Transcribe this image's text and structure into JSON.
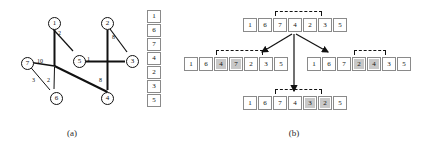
{
  "figure": {
    "panels": [
      {
        "id": "a",
        "caption": "(a)"
      },
      {
        "id": "b",
        "caption": "(b)"
      }
    ]
  },
  "panel_a": {
    "caption": "(a)",
    "graph": {
      "nodes": [
        {
          "id": "1",
          "label": "1",
          "x": 48,
          "y": 17
        },
        {
          "id": "2",
          "label": "2",
          "x": 101,
          "y": 17
        },
        {
          "id": "3",
          "label": "3",
          "x": 126,
          "y": 55
        },
        {
          "id": "4",
          "label": "4",
          "x": 101,
          "y": 92
        },
        {
          "id": "5",
          "label": "5",
          "x": 73,
          "y": 55
        },
        {
          "id": "6",
          "label": "6",
          "x": 50,
          "y": 92
        },
        {
          "id": "7",
          "label": "7",
          "x": 21,
          "y": 57
        }
      ],
      "edges": [
        {
          "from": "1",
          "to": "6",
          "weight": ""
        },
        {
          "from": "1",
          "to": "5",
          "weight": "2"
        },
        {
          "from": "2",
          "to": "4",
          "weight": ""
        },
        {
          "from": "2",
          "to": "3",
          "weight": "8"
        },
        {
          "from": "5",
          "to": "3",
          "weight": "1"
        },
        {
          "from": "7",
          "to": "4",
          "weight": "10"
        },
        {
          "from": "7",
          "to": "6",
          "weight": "3"
        },
        {
          "from": "6",
          "to": "4",
          "weight": "2"
        },
        {
          "from": "4",
          "to": "2",
          "weight": "8"
        }
      ],
      "edge_weight_labels": [
        {
          "text": "2",
          "x": 58,
          "y": 32
        },
        {
          "text": "8",
          "x": 112,
          "y": 36
        },
        {
          "text": "1",
          "x": 86,
          "y": 54
        },
        {
          "text": "10",
          "x": 38,
          "y": 60
        },
        {
          "text": "3",
          "x": 33,
          "y": 79
        },
        {
          "text": "2",
          "x": 47,
          "y": 79
        },
        {
          "text": "8",
          "x": 98,
          "y": 79
        }
      ]
    },
    "tour_column": {
      "values": [
        "1",
        "6",
        "7",
        "4",
        "2",
        "3",
        "5"
      ]
    }
  },
  "panel_b": {
    "caption": "(b)",
    "rows": [
      {
        "id": "parent",
        "values": [
          "1",
          "6",
          "7",
          "4",
          "2",
          "3",
          "5"
        ],
        "shaded": [
          false,
          false,
          false,
          false,
          false,
          false,
          false
        ],
        "bracket": {
          "from": 2,
          "to": 5
        },
        "x": 63,
        "y": 18
      },
      {
        "id": "child-left",
        "values": [
          "1",
          "6",
          "4",
          "7",
          "2",
          "3",
          "5"
        ],
        "shaded": [
          false,
          false,
          true,
          true,
          false,
          false,
          false
        ],
        "bracket": {
          "from": 2,
          "to": 5
        },
        "x": 4,
        "y": 57
      },
      {
        "id": "child-right",
        "values": [
          "1",
          "6",
          "7",
          "2",
          "4",
          "3",
          "5"
        ],
        "shaded": [
          false,
          false,
          false,
          true,
          true,
          false,
          false
        ],
        "bracket": {
          "from": 3,
          "to": 5
        },
        "x": 127,
        "y": 57
      },
      {
        "id": "child-center",
        "values": [
          "1",
          "6",
          "7",
          "4",
          "3",
          "2",
          "5"
        ],
        "shaded": [
          false,
          false,
          false,
          false,
          true,
          true,
          false
        ],
        "bracket": {
          "from": 2,
          "to": 5
        },
        "x": 63,
        "y": 96
      }
    ]
  },
  "colors": {
    "cell_border": "#8a8a8a",
    "cell_fill": "#ffffff",
    "cell_shaded": "#c8c8c8",
    "ink": "#111111"
  }
}
